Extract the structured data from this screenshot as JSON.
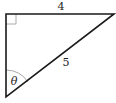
{
  "diagram": {
    "type": "right-triangle",
    "right_angle_vertex": "top-left",
    "sides": {
      "top_leg": "4",
      "hypotenuse": "5"
    },
    "angle_label": "θ",
    "angle_vertex": "bottom-left",
    "colors": {
      "stroke": "#1a1a1a",
      "right_angle_marker": "#aaaaaa",
      "angle_arc": "#aaaaaa"
    }
  }
}
